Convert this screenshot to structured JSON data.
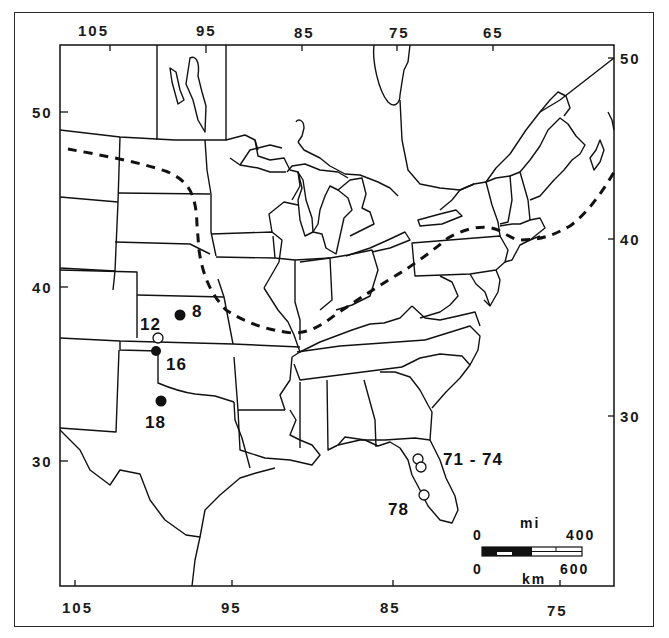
{
  "figure": {
    "type": "distribution map",
    "region": "Eastern and Central United States"
  },
  "axes": {
    "top_longitude_labels": [
      "105",
      "95",
      "85",
      "75",
      "65"
    ],
    "bottom_longitude_labels": [
      "105",
      "95",
      "85",
      "75"
    ],
    "left_latitude_labels": [
      "50",
      "40",
      "30"
    ],
    "right_latitude_labels": [
      "50",
      "40",
      "30"
    ]
  },
  "sites": [
    {
      "label": "8",
      "marker": "filled",
      "description": "Kansas"
    },
    {
      "label": "12",
      "marker": "open",
      "description": "southern Kansas"
    },
    {
      "label": "16",
      "marker": "filled",
      "description": "northern Oklahoma border"
    },
    {
      "label": "18",
      "marker": "filled",
      "description": "northern Texas"
    },
    {
      "label": "71-74",
      "marker": "open",
      "description": "northern Florida"
    },
    {
      "label": "78",
      "marker": "open",
      "description": "central Florida"
    }
  ],
  "site_labels": {
    "s8": "8",
    "s12": "12",
    "s16": "16",
    "s18": "18",
    "s71_74": "71 - 74",
    "s78": "78"
  },
  "legend": {
    "range_line": "dashed boundary",
    "scale_bar": {
      "top_unit": "mi",
      "top_start": "0",
      "top_end": "400",
      "bottom_unit": "km",
      "bottom_start": "0",
      "bottom_end": "600"
    }
  },
  "colors": {
    "ink": "#111111",
    "paper": "#ffffff"
  }
}
